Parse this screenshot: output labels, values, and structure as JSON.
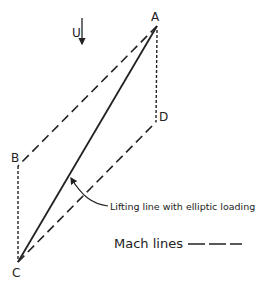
{
  "diagram": {
    "points": {
      "A": {
        "label": "A",
        "x": 157,
        "y": 26
      },
      "B": {
        "label": "B",
        "x": 18,
        "y": 166
      },
      "C": {
        "label": "C",
        "x": 18,
        "y": 262
      },
      "D": {
        "label": "D",
        "x": 156,
        "y": 122
      }
    },
    "flow": {
      "label": "U",
      "direction": "down"
    },
    "annotation": "Lifting line with elliptic loading",
    "legend": {
      "label": "Mach lines"
    },
    "colors": {
      "ink": "#222222",
      "background": "#ffffff"
    }
  }
}
